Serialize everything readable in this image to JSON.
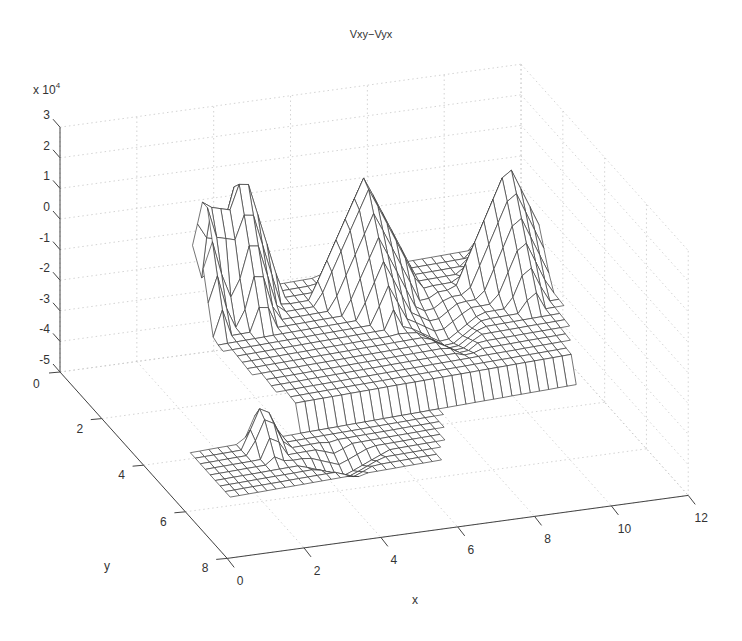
{
  "chart_data": {
    "type": "surface-mesh",
    "title": "Vxy−Vyx",
    "xlabel": "x",
    "ylabel": "y",
    "zlabel": "",
    "z_multiplier_label": "x 10",
    "z_multiplier_exponent": "4",
    "xlim": [
      0,
      12
    ],
    "ylim": [
      0,
      8
    ],
    "zlim": [
      -5,
      3
    ],
    "x_ticks": [
      0,
      2,
      4,
      6,
      8,
      10,
      12
    ],
    "y_ticks": [
      0,
      2,
      4,
      6,
      8
    ],
    "z_ticks": [
      3,
      2,
      1,
      0,
      -1,
      -2,
      -3,
      -4,
      -5
    ],
    "grid": true,
    "surface_description": "Wireframe mesh of Vxy-Vyx difference (x10^4); mostly flat around -2.5 to -3.5 with several sharp peaks reaching about +1 to +2 near x=4-8, y=1-3, and a separate lower strip near y=5-6 around -4 with a peak near x=2.",
    "peaks": [
      {
        "x": 3.2,
        "y": 1.0,
        "z": 1.2
      },
      {
        "x": 4.3,
        "y": 0.8,
        "z": 1.6
      },
      {
        "x": 7.3,
        "y": 1.2,
        "z": 0.9
      },
      {
        "x": 10.8,
        "y": 1.6,
        "z": 0.8
      },
      {
        "x": 2.6,
        "y": 5.5,
        "z": -2.5
      }
    ],
    "base_level": -3.0
  },
  "figure": {
    "title": "Vxy−Vyx",
    "z_scale": "x 10",
    "z_scale_exp": "4",
    "xlabel": "x",
    "ylabel": "y"
  }
}
